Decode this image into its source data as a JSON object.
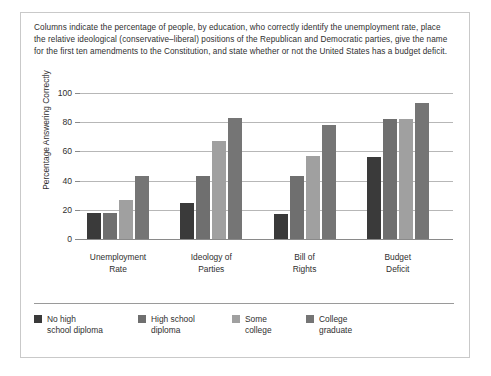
{
  "figure": {
    "caption": "Columns indicate the percentage of people, by education, who correctly identify the unemployment rate, place the relative ideological (conservative–liberal) positions of the Republican and Democratic parties, give the name for the first ten amendments to the Constitution, and state whether or not the United States has a budget deficit."
  },
  "chart_data": {
    "type": "bar",
    "title": "",
    "subtitle": "",
    "xlabel": "",
    "ylabel": "Percentage Answering Correctly",
    "ylim": [
      0,
      100
    ],
    "yticks": [
      0,
      20,
      40,
      60,
      80,
      100
    ],
    "ytick_labels": [
      "0",
      "20",
      "40",
      "60",
      "80",
      "100"
    ],
    "grid": true,
    "legend_position": "bottom",
    "categories": [
      "Unemployment Rate",
      "Ideology of Parties",
      "Bill of Rights",
      "Budget Deficit"
    ],
    "category_lines": [
      [
        "Unemployment",
        "Rate"
      ],
      [
        "Ideology of",
        "Parties"
      ],
      [
        "Bill of",
        "Rights"
      ],
      [
        "Budget",
        "Deficit"
      ]
    ],
    "series": [
      {
        "name": "No high school diploma",
        "name_lines": [
          "No high",
          "school diploma"
        ],
        "color": "#3a3a3a",
        "values": [
          18,
          25,
          17,
          56
        ]
      },
      {
        "name": "High school diploma",
        "name_lines": [
          "High school",
          "diploma"
        ],
        "color": "#6f6f6f",
        "values": [
          18,
          43,
          43,
          82
        ]
      },
      {
        "name": "Some college",
        "name_lines": [
          "Some",
          "college"
        ],
        "color": "#a0a0a0",
        "values": [
          27,
          67,
          57,
          82
        ]
      },
      {
        "name": "College graduate",
        "name_lines": [
          "College",
          "graduate"
        ],
        "color": "#757575",
        "values": [
          43,
          83,
          78,
          93
        ]
      }
    ]
  },
  "colors": {
    "frame": "#c9c9c9",
    "gridline": "#b7b7b7",
    "axis": "#8a8a8a",
    "text": "#2f2f2f"
  }
}
